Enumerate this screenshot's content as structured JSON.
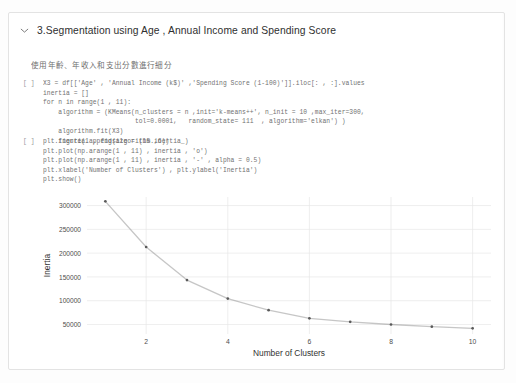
{
  "section": {
    "collapse_icon": "chevron-down-icon",
    "heading": "3.Segmentation using Age , Annual Income and Spending Score",
    "markdown_note": "使用年齡、年收入和支出分數進行細分"
  },
  "cells": [
    {
      "prompt": "[ ]",
      "code": "X3 = df[['Age' , 'Annual Income (k$)' ,'Spending Score (1-100)']].iloc[: , :].values\ninertia = []\nfor n in range(1 , 11):\n    algorithm = (KMeans(n_clusters = n ,init='k-means++', n_init = 10 ,max_iter=300,\n                        tol=0.0001,   random_state= 111  , algorithm='elkan') )\n    algorithm.fit(X3)\n    inertia.append(algorithm.inertia_)"
    },
    {
      "prompt": "[ ]",
      "code": "plt.figure(1 , figsize = (15 ,6))\nplt.plot(np.arange(1 , 11) , inertia , 'o')\nplt.plot(np.arange(1 , 11) , inertia , '-' , alpha = 0.5)\nplt.xlabel('Number of Clusters') , plt.ylabel('Inertia')\nplt.show()"
    }
  ],
  "chart_data": {
    "type": "line",
    "title": "",
    "xlabel": "Number of Clusters",
    "ylabel": "Inertia",
    "x": [
      1,
      2,
      3,
      4,
      5,
      6,
      7,
      8,
      9,
      10
    ],
    "values": [
      308812,
      212840,
      143400,
      104400,
      80000,
      63000,
      55500,
      50000,
      45500,
      42000
    ],
    "xticks": [
      2,
      4,
      6,
      8,
      10
    ],
    "yticks": [
      50000,
      100000,
      150000,
      200000,
      250000,
      300000
    ],
    "xlim": [
      0.55,
      10.45
    ],
    "ylim": [
      30000,
      318000
    ],
    "grid": true,
    "legend": "none",
    "marker": "o",
    "marker_color": "#5a5a5a",
    "line_color": "#8e8e8e",
    "line_alpha": 0.5
  },
  "colors": {
    "card_border": "#e3e3e3",
    "heading_text": "#2f2f2f",
    "code_text": "#6b6b6b",
    "prompt_text": "#9a9a9a",
    "grid": "#e6e6e6",
    "axis_text": "#4d4d4d"
  }
}
